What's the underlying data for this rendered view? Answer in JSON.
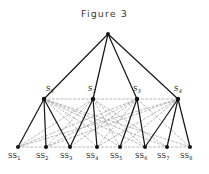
{
  "figure": {
    "title": "Figure  3",
    "colors": {
      "solid_edge": "#1a1a1a",
      "dashed_edge": "#8c8c8c",
      "node_fill": "#111111",
      "label_text": "#2b2b2b",
      "background": "#ffffff"
    }
  },
  "chart_data": {
    "type": "diagram",
    "title": "Figure  3",
    "nodes": {
      "root": {
        "id": "root",
        "label": "",
        "x": 108,
        "y": 34
      },
      "middle": [
        {
          "id": "S5",
          "label": "S",
          "sub": "5",
          "x": 44,
          "y": 99,
          "label_x": 46,
          "label_y": 86
        },
        {
          "id": "S1",
          "label": "S",
          "sub": "1",
          "x": 93,
          "y": 99,
          "label_x": 88,
          "label_y": 86
        },
        {
          "id": "S3",
          "label": "S",
          "sub": "3",
          "x": 137,
          "y": 99,
          "label_x": 133,
          "label_y": 86
        },
        {
          "id": "S4",
          "label": "S",
          "sub": "4",
          "x": 178,
          "y": 99,
          "label_x": 174,
          "label_y": 86
        }
      ],
      "leaves": [
        {
          "id": "SS1",
          "label": "SS",
          "sub": "1",
          "x": 18,
          "y": 147,
          "label_x": 8,
          "label_y": 153
        },
        {
          "id": "SS2",
          "label": "SS",
          "sub": "2",
          "x": 46,
          "y": 147,
          "label_x": 36,
          "label_y": 153
        },
        {
          "id": "SS3",
          "label": "SS",
          "sub": "3",
          "x": 70,
          "y": 147,
          "label_x": 60,
          "label_y": 153
        },
        {
          "id": "SS4",
          "label": "SS",
          "sub": "4",
          "x": 97,
          "y": 147,
          "label_x": 86,
          "label_y": 153
        },
        {
          "id": "SS5",
          "label": "SS",
          "sub": "5",
          "x": 120,
          "y": 147,
          "label_x": 110,
          "label_y": 153
        },
        {
          "id": "SS6",
          "label": "SS",
          "sub": "6",
          "x": 145,
          "y": 147,
          "label_x": 135,
          "label_y": 153
        },
        {
          "id": "SS7",
          "label": "SS",
          "sub": "7",
          "x": 167,
          "y": 147,
          "label_x": 157,
          "label_y": 153
        },
        {
          "id": "SS8",
          "label": "SS",
          "sub": "8",
          "x": 190,
          "y": 147,
          "label_x": 180,
          "label_y": 153
        }
      ]
    },
    "edges": {
      "solid": [
        [
          "root",
          "S5"
        ],
        [
          "root",
          "S1"
        ],
        [
          "root",
          "S3"
        ],
        [
          "root",
          "S4"
        ],
        [
          "S5",
          "SS1"
        ],
        [
          "S5",
          "SS2"
        ],
        [
          "S5",
          "SS3"
        ],
        [
          "S1",
          "SS3"
        ],
        [
          "S1",
          "SS4"
        ],
        [
          "S3",
          "SS5"
        ],
        [
          "S3",
          "SS6"
        ],
        [
          "S4",
          "SS6"
        ],
        [
          "S4",
          "SS7"
        ],
        [
          "S4",
          "SS8"
        ]
      ],
      "dashed": [
        [
          "S5",
          "S1"
        ],
        [
          "S1",
          "S3"
        ],
        [
          "S3",
          "S4"
        ],
        [
          "S5",
          "SS4"
        ],
        [
          "S5",
          "SS5"
        ],
        [
          "S5",
          "SS6"
        ],
        [
          "S5",
          "SS7"
        ],
        [
          "S5",
          "SS8"
        ],
        [
          "S1",
          "SS1"
        ],
        [
          "S1",
          "SS2"
        ],
        [
          "S1",
          "SS5"
        ],
        [
          "S1",
          "SS6"
        ],
        [
          "S1",
          "SS7"
        ],
        [
          "S3",
          "SS1"
        ],
        [
          "S3",
          "SS2"
        ],
        [
          "S3",
          "SS3"
        ],
        [
          "S3",
          "SS4"
        ],
        [
          "S3",
          "SS8"
        ],
        [
          "S4",
          "SS1"
        ],
        [
          "S4",
          "SS2"
        ],
        [
          "S4",
          "SS4"
        ],
        [
          "S4",
          "SS5"
        ],
        [
          "SS1",
          "SS2"
        ],
        [
          "SS2",
          "SS3"
        ],
        [
          "SS3",
          "SS4"
        ],
        [
          "SS4",
          "SS5"
        ],
        [
          "SS5",
          "SS6"
        ],
        [
          "SS6",
          "SS7"
        ],
        [
          "SS7",
          "SS8"
        ]
      ]
    }
  }
}
